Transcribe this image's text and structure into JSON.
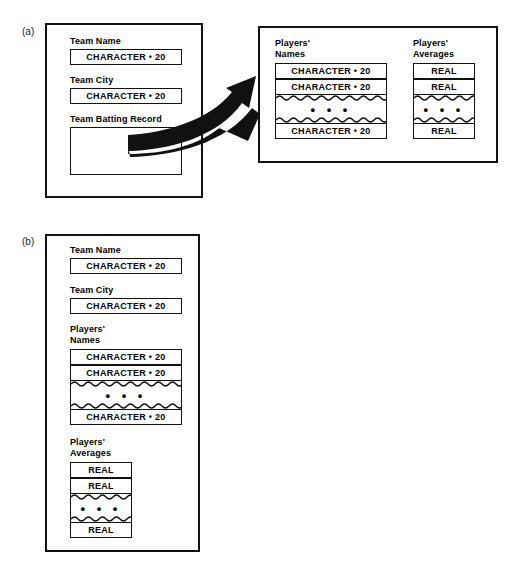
{
  "figure": {
    "type": "record-structure-diagram",
    "panels": [
      {
        "id": "a",
        "label": "(a)",
        "boxes": [
          {
            "id": "team-record",
            "fields": [
              {
                "label": "Team Name",
                "slot": "CHARACTER • 20"
              },
              {
                "label": "Team City",
                "slot": "CHARACTER • 20"
              },
              {
                "label": "Team Batting Record",
                "slot": ""
              }
            ]
          },
          {
            "id": "batting-record",
            "columns": [
              {
                "label": "Players'\nNames",
                "cells": [
                  "CHARACTER • 20",
                  "CHARACTER • 20",
                  "• • •",
                  "CHARACTER • 20"
                ]
              },
              {
                "label": "Players'\nAverages",
                "cells": [
                  "REAL",
                  "REAL",
                  "• • •",
                  "REAL"
                ]
              }
            ]
          }
        ]
      },
      {
        "id": "b",
        "label": "(b)",
        "boxes": [
          {
            "id": "flat-team-record",
            "fields": [
              {
                "label": "Team Name",
                "slot": "CHARACTER • 20"
              },
              {
                "label": "Team City",
                "slot": "CHARACTER • 20"
              }
            ],
            "arrays": [
              {
                "label": "Players'\nNames",
                "cells": [
                  "CHARACTER • 20",
                  "CHARACTER • 20",
                  "• • •",
                  "CHARACTER • 20"
                ]
              },
              {
                "label": "Players'\nAverages",
                "cells": [
                  "REAL",
                  "REAL",
                  "• • •",
                  "REAL"
                ]
              }
            ]
          }
        ]
      }
    ],
    "ellipsis_glyph": "• • •",
    "colors": {
      "stroke": "#111111",
      "background": "#ffffff",
      "text": "#000000"
    }
  }
}
